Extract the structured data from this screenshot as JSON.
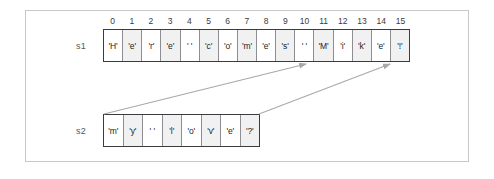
{
  "diagram": {
    "frame_color": "#c8c8cc",
    "arrow_color": "#a8a8ac",
    "cell_border_color": "#8e8e92",
    "array_border_color": "#3c3c40",
    "shaded_cell_color": "#f1f1f1"
  },
  "index_ruler": {
    "labels": [
      "0",
      "1",
      "2",
      "3",
      "4",
      "5",
      "6",
      "7",
      "8",
      "9",
      "10",
      "11",
      "12",
      "13",
      "14",
      "15"
    ]
  },
  "arrays": [
    {
      "name": "s1",
      "label": "s1",
      "cells": [
        {
          "text": "'H'",
          "shaded": false
        },
        {
          "text": "'e'",
          "shaded": true
        },
        {
          "text": "'r'",
          "shaded": false
        },
        {
          "text": "'e'",
          "shaded": true
        },
        {
          "text": "' '",
          "shaded": false
        },
        {
          "text": "'c'",
          "shaded": true
        },
        {
          "text": "'o'",
          "shaded": false
        },
        {
          "text": "'m'",
          "shaded": true
        },
        {
          "text": "'e'",
          "shaded": false
        },
        {
          "text": "'s'",
          "shaded": true
        },
        {
          "text": "' '",
          "shaded": false
        },
        {
          "text": "'M'",
          "shaded": true
        },
        {
          "text": "'i'",
          "shaded": false
        },
        {
          "text": "'k'",
          "shaded": true
        },
        {
          "text": "'e'",
          "shaded": false
        },
        {
          "text": "'!'",
          "shaded": true
        }
      ]
    },
    {
      "name": "s2",
      "label": "s2",
      "cells": [
        {
          "text": "'m'",
          "shaded": false
        },
        {
          "text": "'y'",
          "shaded": true
        },
        {
          "text": "' '",
          "shaded": false
        },
        {
          "text": "'l'",
          "shaded": true
        },
        {
          "text": "'o'",
          "shaded": false
        },
        {
          "text": "'v'",
          "shaded": true
        },
        {
          "text": "'e'",
          "shaded": false
        },
        {
          "text": "'?'",
          "shaded": true
        }
      ]
    }
  ],
  "arrows": [
    {
      "name": "arrow-s2-start-to-s1-index-11",
      "from": {
        "x": 104,
        "y": 114
      },
      "to": {
        "x": 306,
        "y": 64
      }
    },
    {
      "name": "arrow-s2-end-to-s1-index-15",
      "from": {
        "x": 259,
        "y": 114
      },
      "to": {
        "x": 390,
        "y": 64
      }
    }
  ]
}
